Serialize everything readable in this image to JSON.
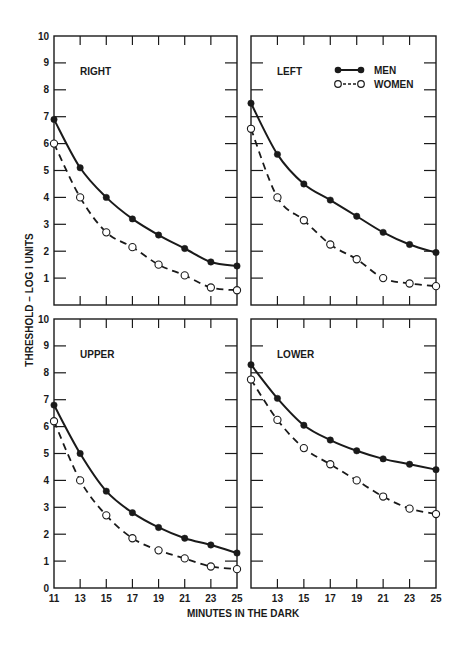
{
  "figure": {
    "y_axis_title": "THRESHOLD – LOG I UNITS",
    "x_axis_title": "MINUTES IN THE DARK",
    "legend": {
      "men": "MEN",
      "women": "WOMEN"
    },
    "colors": {
      "ink": "#1a1a1a",
      "background": "#ffffff"
    }
  },
  "chart_data": [
    {
      "type": "line",
      "title": "RIGHT",
      "xlabel": "MINUTES IN THE DARK",
      "ylabel": "THRESHOLD – LOG I UNITS",
      "x": [
        11,
        13,
        15,
        17,
        19,
        21,
        23,
        25
      ],
      "xticks": [],
      "yticks": [
        1,
        2,
        3,
        4,
        5,
        6,
        7,
        8,
        9,
        10
      ],
      "ylim": [
        0,
        10
      ],
      "xlim": [
        11,
        25
      ],
      "grid": false,
      "legend_position": "none",
      "series": [
        {
          "name": "MEN",
          "style": "solid, filled circles",
          "values": [
            6.9,
            5.1,
            4.0,
            3.2,
            2.6,
            2.1,
            1.6,
            1.45
          ]
        },
        {
          "name": "WOMEN",
          "style": "dashed, open circles",
          "values": [
            6.0,
            4.0,
            2.7,
            2.15,
            1.5,
            1.1,
            0.65,
            0.55
          ]
        }
      ]
    },
    {
      "type": "line",
      "title": "LEFT",
      "xlabel": "MINUTES IN THE DARK",
      "ylabel": "THRESHOLD – LOG I UNITS",
      "x": [
        11,
        13,
        15,
        17,
        19,
        21,
        23,
        25
      ],
      "xticks": [],
      "yticks": [],
      "ylim": [
        0,
        10
      ],
      "xlim": [
        11,
        25
      ],
      "grid": false,
      "legend_position": "upper right",
      "series": [
        {
          "name": "MEN",
          "style": "solid, filled circles",
          "values": [
            7.5,
            5.6,
            4.5,
            3.9,
            3.3,
            2.7,
            2.25,
            1.95
          ]
        },
        {
          "name": "WOMEN",
          "style": "dashed, open circles",
          "values": [
            6.55,
            4.0,
            3.15,
            2.25,
            1.7,
            1.0,
            0.8,
            0.7
          ]
        }
      ]
    },
    {
      "type": "line",
      "title": "UPPER",
      "xlabel": "MINUTES IN THE DARK",
      "ylabel": "THRESHOLD – LOG I UNITS",
      "x": [
        11,
        13,
        15,
        17,
        19,
        21,
        23,
        25
      ],
      "xticks": [
        11,
        13,
        15,
        17,
        19,
        21,
        23,
        25
      ],
      "yticks": [
        0,
        1,
        2,
        3,
        4,
        5,
        6,
        7,
        8,
        9,
        10
      ],
      "ylim": [
        0,
        10
      ],
      "xlim": [
        11,
        25
      ],
      "grid": false,
      "legend_position": "none",
      "series": [
        {
          "name": "MEN",
          "style": "solid, filled circles",
          "values": [
            6.8,
            5.0,
            3.6,
            2.8,
            2.25,
            1.85,
            1.6,
            1.3
          ]
        },
        {
          "name": "WOMEN",
          "style": "dashed, open circles",
          "values": [
            6.2,
            4.0,
            2.7,
            1.85,
            1.4,
            1.1,
            0.8,
            0.7
          ]
        }
      ]
    },
    {
      "type": "line",
      "title": "LOWER",
      "xlabel": "MINUTES IN THE DARK",
      "ylabel": "THRESHOLD – LOG I UNITS",
      "x": [
        11,
        13,
        15,
        17,
        19,
        21,
        23,
        25
      ],
      "xticks": [
        13,
        15,
        17,
        19,
        21,
        23,
        25
      ],
      "yticks": [],
      "ylim": [
        0,
        10
      ],
      "xlim": [
        11,
        25
      ],
      "grid": false,
      "legend_position": "none",
      "series": [
        {
          "name": "MEN",
          "style": "solid, filled circles",
          "values": [
            8.3,
            7.05,
            6.05,
            5.5,
            5.1,
            4.8,
            4.6,
            4.4
          ]
        },
        {
          "name": "WOMEN",
          "style": "dashed, open circles",
          "values": [
            7.75,
            6.25,
            5.2,
            4.6,
            4.0,
            3.4,
            2.95,
            2.75
          ]
        }
      ]
    }
  ],
  "layout": {
    "panels": [
      {
        "x0": 54,
        "x1": 237,
        "y0": 36,
        "y1": 305,
        "label_x": 80,
        "label_y": 75,
        "show_yticklabels": true,
        "show_xticklabels": false
      },
      {
        "x0": 251,
        "x1": 436,
        "y0": 36,
        "y1": 305,
        "label_x": 277,
        "label_y": 75,
        "show_yticklabels": false,
        "show_xticklabels": false
      },
      {
        "x0": 54,
        "x1": 237,
        "y0": 319,
        "y1": 588,
        "label_x": 80,
        "label_y": 358,
        "show_yticklabels": true,
        "show_xticklabels": true
      },
      {
        "x0": 251,
        "x1": 436,
        "y0": 319,
        "y1": 588,
        "label_x": 277,
        "label_y": 358,
        "show_yticklabels": false,
        "show_xticklabels": true
      }
    ]
  }
}
